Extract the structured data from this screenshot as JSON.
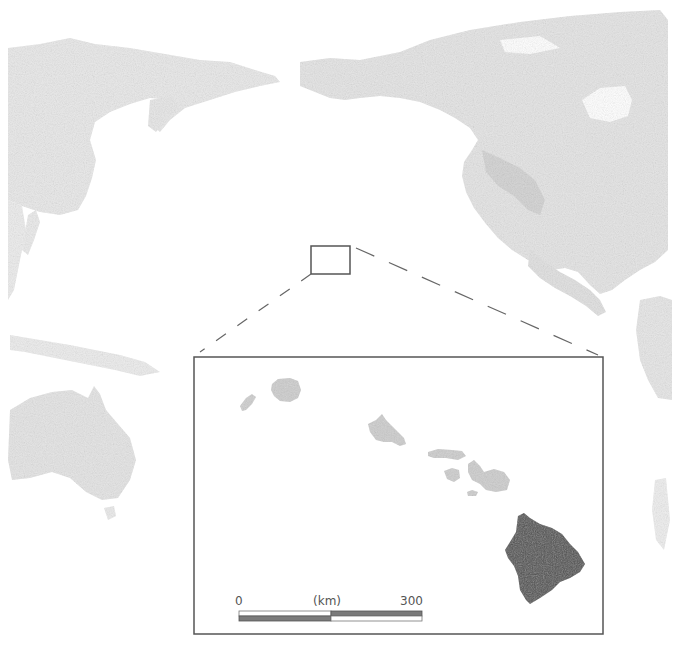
{
  "map": {
    "title": "",
    "overview_region": "Pacific Ocean",
    "colors": {
      "background": "#ffffff",
      "land_light": "#e6e6e6",
      "land_mid": "#dcdcdc",
      "land_dark_relief": "#cfcfcf",
      "inset_islands": "#cdcdcd",
      "highlight_island": "#505050",
      "frame": "#555555",
      "dashed_lines": "#666666"
    },
    "overview_landmasses": [
      "Asia",
      "North America",
      "Australia",
      "South America (edge)",
      "Pacific islands"
    ],
    "selection_box": {
      "x": 311,
      "y": 246,
      "width": 39,
      "height": 28
    },
    "inset": {
      "frame": {
        "x": 194,
        "y": 357,
        "width": 409,
        "height": 277
      },
      "islands": [
        {
          "name": "Niihau",
          "highlighted": false
        },
        {
          "name": "Kauai",
          "highlighted": false
        },
        {
          "name": "Oahu",
          "highlighted": false
        },
        {
          "name": "Molokai",
          "highlighted": false
        },
        {
          "name": "Lanai",
          "highlighted": false
        },
        {
          "name": "Maui",
          "highlighted": false
        },
        {
          "name": "Kahoolawe",
          "highlighted": false
        },
        {
          "name": "Hawaii (Big Island)",
          "highlighted": true
        }
      ],
      "scale_bar": {
        "start_label": "0",
        "unit_label": "(km)",
        "end_label": "300"
      }
    }
  }
}
